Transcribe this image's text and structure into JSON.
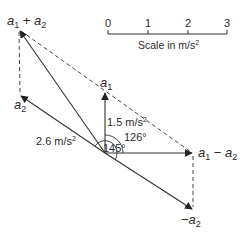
{
  "scale": {
    "ticks": [
      "0",
      "1",
      "2",
      "3"
    ],
    "label_prefix": "Scale in m/s",
    "label_sup": "2"
  },
  "vectors": {
    "a1": {
      "label": "a",
      "sub": "1",
      "magnitude_text": "1.5 m/s",
      "magnitude_sup": "2"
    },
    "a2": {
      "label": "a",
      "sub": "2",
      "magnitude_text": "2.6 m/s",
      "magnitude_sup": "2"
    },
    "sum": {
      "label_a": "a",
      "sub1": "1",
      "op": " + ",
      "label_b": "a",
      "sub2": "2"
    },
    "diff": {
      "label_a": "a",
      "sub1": "1",
      "op": " − ",
      "label_b": "a",
      "sub2": "2"
    },
    "neg_a2": {
      "prefix": "−",
      "label": "a",
      "sub": "2"
    }
  },
  "angles": {
    "a1_to_diff": "126°",
    "a2_to_diff": "145°"
  },
  "colors": {
    "line": "#333333",
    "text": "#2a2a2a",
    "background": "#ffffff"
  }
}
